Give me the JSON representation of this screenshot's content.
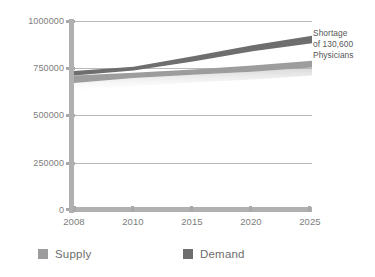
{
  "chart_data": {
    "type": "area",
    "title": "",
    "xlabel": "",
    "ylabel": "",
    "categories": [
      "2008",
      "2010",
      "2015",
      "2020",
      "2025"
    ],
    "x_positions": [
      2008,
      2010,
      2015,
      2020,
      2025
    ],
    "ylim": [
      0,
      1000000
    ],
    "xlim": [
      2008,
      2025
    ],
    "y_ticks": [
      0,
      250000,
      500000,
      750000,
      1000000
    ],
    "y_tick_labels": [
      "0",
      "250000",
      "500000",
      "750000",
      "1000000"
    ],
    "x_tick_labels": [
      "2008",
      "2010",
      "2015",
      "2020",
      "2025"
    ],
    "grid": true,
    "legend_position": "bottom",
    "series": [
      {
        "name": "Supply",
        "color": "#9d9d9d",
        "band": true,
        "values": [
          690000,
          712000,
          730000,
          748000,
          772000
        ],
        "band_upper": [
          712000,
          726000,
          744000,
          764000,
          790000
        ],
        "band_lower": [
          672000,
          698000,
          716000,
          732000,
          754000
        ]
      },
      {
        "name": "Demand",
        "color": "#6e6e6e",
        "band": true,
        "values": [
          724000,
          748000,
          800000,
          856000,
          902000
        ],
        "band_upper": [
          736000,
          758000,
          814000,
          872000,
          922000
        ],
        "band_lower": [
          712000,
          738000,
          786000,
          840000,
          882000
        ]
      }
    ],
    "annotations": [
      {
        "id": "shortage-callout",
        "lines": [
          "Shortage",
          "of 130,600",
          "Physicians"
        ],
        "text": "Shortage of 130,600 Physicians",
        "value": 130600,
        "at_year": 2025
      }
    ]
  },
  "legend": {
    "items": [
      {
        "label": "Supply",
        "color": "#9d9d9d"
      },
      {
        "label": "Demand",
        "color": "#6e6e6e"
      }
    ]
  },
  "colors": {
    "supply": "#9d9d9d",
    "demand": "#6e6e6e",
    "axis": "#b0b0b0",
    "gridline": "#b9b9b9",
    "text": "#7d7d7d",
    "annotation_text": "#585858",
    "background": "#ffffff"
  }
}
